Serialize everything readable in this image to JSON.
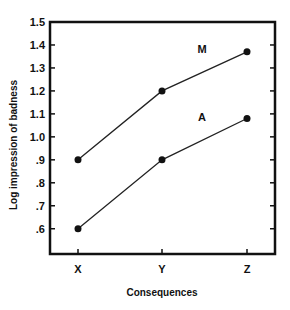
{
  "chart_data": {
    "type": "line",
    "title": "",
    "xlabel": "Consequences",
    "ylabel": "Log impression of badness",
    "categories": [
      "X",
      "Y",
      "Z"
    ],
    "series": [
      {
        "name": "M",
        "values": [
          0.9,
          1.2,
          1.37
        ]
      },
      {
        "name": "A",
        "values": [
          0.6,
          0.9,
          1.08
        ]
      }
    ],
    "ylim": [
      0.49,
      1.5
    ],
    "yticks": [
      0.6,
      0.7,
      0.8,
      0.9,
      1.0,
      1.1,
      1.2,
      1.3,
      1.4,
      1.5
    ],
    "ytick_labels": [
      ".6",
      ".7",
      ".8",
      ".9",
      "1.0",
      "1.1",
      "1.2",
      "1.3",
      "1.4",
      "1.5"
    ],
    "grid": false,
    "legend": "inline labels above each line",
    "colors": {
      "line": "#222222",
      "frame": "#111111",
      "marker": "#111111"
    }
  }
}
